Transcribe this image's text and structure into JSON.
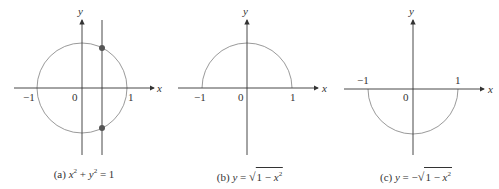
{
  "panels": [
    {
      "id": "a",
      "caption_prefix": "(a)",
      "caption_parts": {
        "x": "x",
        "exp": "2",
        "plus": " + ",
        "y": "y",
        "exp2": "2",
        "eq": " = 1"
      },
      "x_axis_label": "x",
      "y_axis_label": "y",
      "tick_labels": {
        "neg_one": "−1",
        "zero": "0",
        "one": "1"
      },
      "curve": "full circle",
      "vertical_line": true,
      "intersection_points": 2
    },
    {
      "id": "b",
      "caption_prefix": "(b)",
      "caption_parts": {
        "y": "y",
        "eq": " = ",
        "root_sym": "√",
        "radicand_a": "1 − ",
        "x": "x",
        "exp": "2"
      },
      "x_axis_label": "x",
      "y_axis_label": "y",
      "tick_labels": {
        "neg_one": "−1",
        "zero": "0",
        "one": "1"
      },
      "curve": "upper semicircle"
    },
    {
      "id": "c",
      "caption_prefix": "(c)",
      "caption_parts": {
        "y": "y",
        "eq": " = −",
        "root_sym": "√",
        "radicand_a": "1 − ",
        "x": "x",
        "exp": "2"
      },
      "x_axis_label": "x",
      "y_axis_label": "y",
      "tick_labels": {
        "neg_one": "−1",
        "zero": "0",
        "one": "1"
      },
      "curve": "lower semicircle"
    }
  ],
  "colors": {
    "curve": "#9a9a9a",
    "axis": "#333333",
    "point": "#555555"
  }
}
